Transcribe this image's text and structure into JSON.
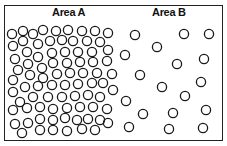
{
  "diagram": {
    "areas": [
      {
        "label": "Area A",
        "density": "high"
      },
      {
        "label": "Area B",
        "density": "low"
      }
    ],
    "circle_radius": 4.6,
    "stroke_color": "#1a1a1a",
    "area_a_circles": [
      [
        12,
        34
      ],
      [
        23,
        31
      ],
      [
        33,
        34
      ],
      [
        43,
        30
      ],
      [
        56,
        31
      ],
      [
        68,
        30
      ],
      [
        82,
        31
      ],
      [
        95,
        31
      ],
      [
        108,
        33
      ],
      [
        13,
        46
      ],
      [
        23,
        41
      ],
      [
        38,
        44
      ],
      [
        50,
        41
      ],
      [
        62,
        40
      ],
      [
        73,
        41
      ],
      [
        87,
        41
      ],
      [
        100,
        42
      ],
      [
        15,
        59
      ],
      [
        27,
        52
      ],
      [
        38,
        57
      ],
      [
        52,
        53
      ],
      [
        65,
        52
      ],
      [
        78,
        52
      ],
      [
        92,
        52
      ],
      [
        108,
        50
      ],
      [
        18,
        70
      ],
      [
        28,
        64
      ],
      [
        42,
        68
      ],
      [
        53,
        63
      ],
      [
        67,
        63
      ],
      [
        80,
        62
      ],
      [
        93,
        62
      ],
      [
        107,
        61
      ],
      [
        13,
        80
      ],
      [
        30,
        75
      ],
      [
        43,
        78
      ],
      [
        57,
        74
      ],
      [
        70,
        73
      ],
      [
        83,
        73
      ],
      [
        97,
        73
      ],
      [
        112,
        74
      ],
      [
        13,
        92
      ],
      [
        25,
        87
      ],
      [
        38,
        86
      ],
      [
        52,
        85
      ],
      [
        65,
        85
      ],
      [
        78,
        84
      ],
      [
        92,
        83
      ],
      [
        103,
        83
      ],
      [
        20,
        102
      ],
      [
        33,
        97
      ],
      [
        48,
        97
      ],
      [
        62,
        97
      ],
      [
        75,
        96
      ],
      [
        88,
        95
      ],
      [
        100,
        97
      ],
      [
        113,
        90
      ],
      [
        13,
        110
      ],
      [
        27,
        108
      ],
      [
        40,
        107
      ],
      [
        53,
        109
      ],
      [
        67,
        108
      ],
      [
        80,
        107
      ],
      [
        93,
        107
      ],
      [
        107,
        109
      ],
      [
        15,
        124
      ],
      [
        28,
        123
      ],
      [
        40,
        119
      ],
      [
        53,
        120
      ],
      [
        65,
        118
      ],
      [
        77,
        120
      ],
      [
        88,
        119
      ],
      [
        100,
        120
      ],
      [
        22,
        133
      ],
      [
        40,
        130
      ],
      [
        53,
        130
      ],
      [
        67,
        131
      ],
      [
        82,
        129
      ],
      [
        95,
        130
      ],
      [
        108,
        123
      ]
    ],
    "area_b_circles": [
      [
        135,
        35
      ],
      [
        184,
        34
      ],
      [
        209,
        34
      ],
      [
        157,
        47
      ],
      [
        125,
        55
      ],
      [
        177,
        64
      ],
      [
        204,
        59
      ],
      [
        140,
        75
      ],
      [
        201,
        82
      ],
      [
        162,
        87
      ],
      [
        185,
        96
      ],
      [
        126,
        101
      ],
      [
        143,
        114
      ],
      [
        173,
        113
      ],
      [
        206,
        110
      ],
      [
        129,
        127
      ],
      [
        169,
        129
      ],
      [
        203,
        128
      ]
    ]
  }
}
